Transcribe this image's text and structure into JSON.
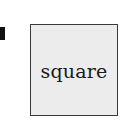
{
  "diagram": {
    "shape": {
      "type": "square",
      "label": "square",
      "fill_color": "#ececec",
      "border_color": "#3a3a3a"
    },
    "edge_mark_color": "#111111"
  }
}
